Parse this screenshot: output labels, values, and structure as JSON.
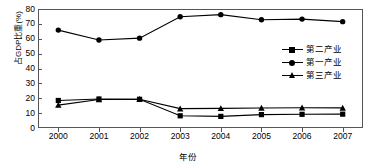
{
  "chart_data": {
    "type": "line",
    "title": "",
    "xlabel": "年份",
    "ylabel": "占GDP比重(%)",
    "categories": [
      "2000",
      "2001",
      "2002",
      "2003",
      "2004",
      "2005",
      "2006",
      "2007"
    ],
    "x": [
      2000,
      2001,
      2002,
      2003,
      2004,
      2005,
      2006,
      2007
    ],
    "xlim": [
      1999.5,
      2007.5
    ],
    "ylim": [
      0,
      80
    ],
    "yticks": [
      0,
      10,
      20,
      30,
      40,
      50,
      60,
      70,
      80
    ],
    "ytick_labels": [
      "0",
      "10",
      "20",
      "30",
      "40",
      "50",
      "60",
      "70",
      "80"
    ],
    "grid": false,
    "legend_position": "inside-right",
    "series": [
      {
        "name": "第二产业",
        "marker": "square",
        "values": [
          18.5,
          19.5,
          19.3,
          8.2,
          7.8,
          9.0,
          9.2,
          9.3
        ]
      },
      {
        "name": "第一产业",
        "marker": "circle",
        "values": [
          65.8,
          59.2,
          60.4,
          74.8,
          76.2,
          72.8,
          73.2,
          71.5
        ]
      },
      {
        "name": "第三产业",
        "marker": "triangle",
        "values": [
          15.4,
          19.2,
          19.3,
          13.0,
          13.2,
          13.4,
          13.6,
          13.5
        ]
      }
    ]
  },
  "legend": {
    "items": [
      {
        "label": "第二产业",
        "marker": "square"
      },
      {
        "label": "第一产业",
        "marker": "circle"
      },
      {
        "label": "第三产业",
        "marker": "triangle"
      }
    ]
  },
  "axes": {
    "y_title": "占GDP比重(%)",
    "x_title": "年份"
  },
  "colors": {
    "series": "#000000",
    "frame": "#555555",
    "background": "#ffffff"
  }
}
